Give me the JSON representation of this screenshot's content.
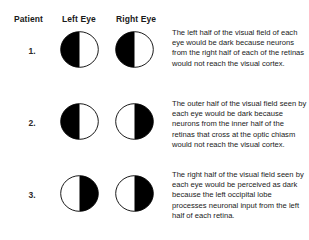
{
  "figure": {
    "background_color": "#ffffff",
    "ink_color": "#000000"
  },
  "table": {
    "headers": {
      "patient": "Patient",
      "left_eye": "Left Eye",
      "right_eye": "Right Eye"
    },
    "rows": [
      {
        "label": "1.",
        "left_eye": {
          "dark_side": "left",
          "alt": "Circle with left half filled black, right half white"
        },
        "right_eye": {
          "dark_side": "left",
          "alt": "Circle with left half filled black, right half white"
        },
        "description": "The left half of the visual field of each eye would be dark because neurons from the right half of each of the retinas would not reach the visual cortex."
      },
      {
        "label": "2.",
        "left_eye": {
          "dark_side": "left",
          "alt": "Circle with left half filled black, right half white"
        },
        "right_eye": {
          "dark_side": "right",
          "alt": "Circle with right half filled black, left half white"
        },
        "description": "The outer half of the visual field seen by each eye would be dark because neurons from the inner half of the retinas that cross at the optic chiasm would not reach the visual cortex."
      },
      {
        "label": "3.",
        "left_eye": {
          "dark_side": "right",
          "alt": "Circle with right half filled black, left half white"
        },
        "right_eye": {
          "dark_side": "right",
          "alt": "Circle with right half filled black, left half white"
        },
        "description": "The right half of the visual field seen by each eye would be perceived as dark because the left occipital lobe processes neuronal input from the left half of each retina."
      }
    ]
  }
}
